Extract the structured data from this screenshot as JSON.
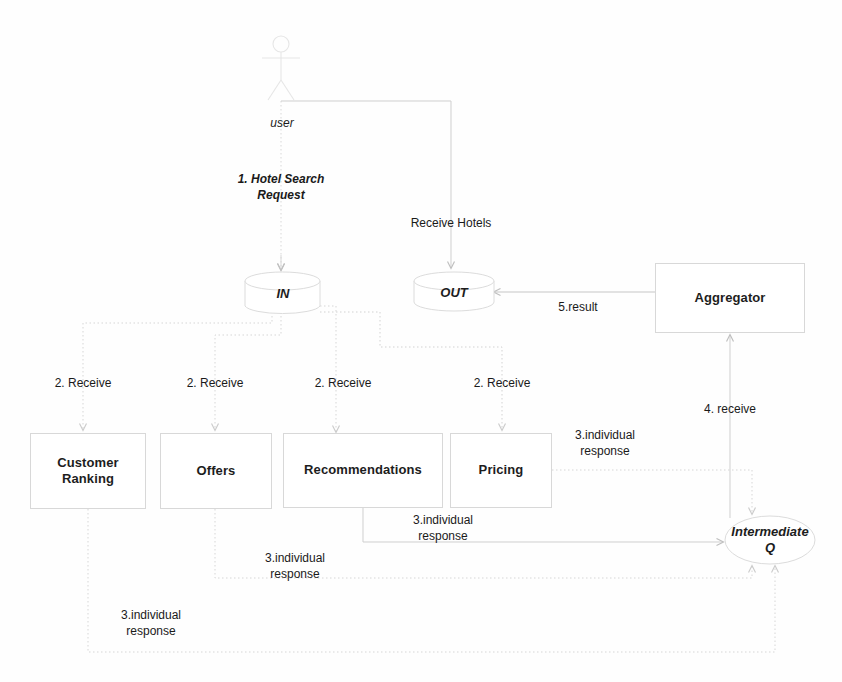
{
  "diagram": {
    "background": "#fefefe",
    "line_color": "#c9c9c9",
    "line_color_dotted": "#d2d2d2",
    "node_border": "#d8d8d8",
    "text_color": "#1a1a1a"
  },
  "actor": {
    "name": "user",
    "label": "user",
    "icon": "stick-figure-actor"
  },
  "nodes": {
    "in_queue": {
      "label": "IN",
      "shape": "cylinder"
    },
    "out_queue": {
      "label": "OUT",
      "shape": "cylinder"
    },
    "aggregator": {
      "label": "Aggregator",
      "shape": "rect"
    },
    "intermediate_q": {
      "label": "Intermediate\nQ",
      "line1": "Intermediate",
      "line2": "Q",
      "shape": "ellipse"
    },
    "services": [
      {
        "id": "customer-ranking",
        "label": "Customer\nRanking",
        "line1": "Customer",
        "line2": "Ranking"
      },
      {
        "id": "offers",
        "label": "Offers",
        "line1": "Offers",
        "line2": ""
      },
      {
        "id": "recommendations",
        "label": "Recommendations",
        "line1": "Recommendations",
        "line2": ""
      },
      {
        "id": "pricing",
        "label": "Pricing",
        "line1": "Pricing",
        "line2": ""
      }
    ]
  },
  "edge_labels": {
    "hotel_search_request": "1. Hotel Search\nRequest",
    "receive_hotels": "Receive Hotels",
    "receive_1": "2. Receive",
    "receive_2": "2. Receive",
    "receive_3": "2. Receive",
    "receive_4": "2. Receive",
    "individual_response_pricing": "3.individual\nresponse",
    "individual_response_recommendations": "3.individual\nresponse",
    "individual_response_offers": "3.individual\nresponse",
    "individual_response_customer_ranking": "3.individual\nresponse",
    "receive_aggregator": "4. receive",
    "result": "5.result"
  }
}
